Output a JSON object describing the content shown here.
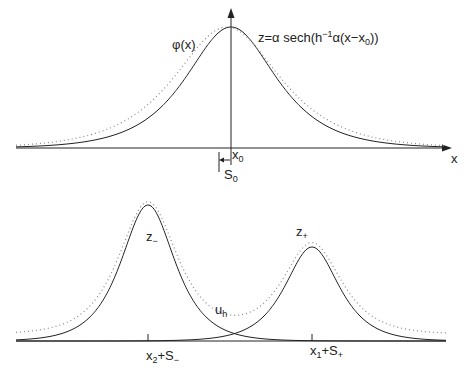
{
  "top_panel": {
    "phi_label": "φ(x)",
    "formula_prefix": "z=α sech(h",
    "formula_exp": "−1",
    "formula_mid": "α(x−x",
    "formula_sub": "0",
    "formula_suffix": "))",
    "x0_main": "x",
    "x0_sub": "0",
    "s0_main": "S",
    "s0_sub": "0",
    "x_axis_label": "x"
  },
  "bottom_panel": {
    "z_minus_main": "z",
    "z_minus_sub": "−",
    "z_plus_main": "z",
    "z_plus_sub": "+",
    "uh_main": "u",
    "uh_sub": "h",
    "left_tick_main1": "x",
    "left_tick_sub1": "2",
    "left_tick_main2": "+S",
    "left_tick_sub2": "−",
    "right_tick_main1": "x",
    "right_tick_sub1": "1",
    "right_tick_main2": "+S",
    "right_tick_sub2": "+"
  },
  "colors": {
    "line": "#222222",
    "dotted": "#999999"
  }
}
